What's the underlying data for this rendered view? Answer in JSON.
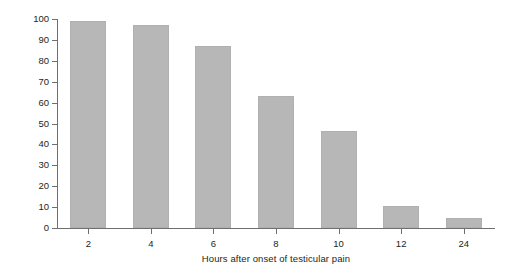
{
  "chart_data": {
    "type": "bar",
    "title": "",
    "subtitle": "",
    "xlabel": "Hours after onset of testicular pain",
    "ylabel": "Salvage rates (%)",
    "categories": [
      "2",
      "4",
      "6",
      "8",
      "10",
      "12",
      "24"
    ],
    "values": [
      99,
      97,
      87,
      63,
      46.5,
      10.5,
      5
    ],
    "ylim": [
      0,
      100
    ],
    "yticks": [
      0,
      10,
      20,
      30,
      40,
      50,
      60,
      70,
      80,
      90,
      100
    ],
    "ytick_labels": [
      "0",
      "10",
      "20",
      "30",
      "40",
      "50",
      "60",
      "70",
      "80",
      "90",
      "100"
    ],
    "grid": false,
    "legend": null,
    "legend_position": "none",
    "annotations": [],
    "series": [
      {
        "name": "Salvage rate",
        "values": [
          99,
          97,
          87,
          63,
          46.5,
          10.5,
          5
        ]
      }
    ],
    "colors": {
      "bar_fill": "#b7b7b7",
      "bar_stroke": "#b0b0b0",
      "axis": "#6f6f6f",
      "text": "#231f20",
      "background": "#ffffff"
    }
  }
}
